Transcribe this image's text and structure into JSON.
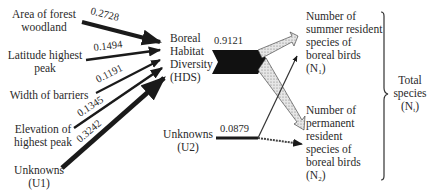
{
  "predictors": [
    {
      "id": "forest",
      "line1": "Area of forest",
      "line2": "woodland",
      "coef": "0.2728"
    },
    {
      "id": "latitude",
      "line1": "Latitude highest",
      "line2": "peak",
      "coef": "0.1494"
    },
    {
      "id": "barriers",
      "line1": "Width of barriers",
      "line2": "",
      "coef": "0.1191"
    },
    {
      "id": "elevation",
      "line1": "Elevation of",
      "line2": "highest peak",
      "coef": "0.1345"
    },
    {
      "id": "u1",
      "line1": "Unknowns",
      "line2": "(U1)",
      "coef": "0.3242"
    }
  ],
  "hds": {
    "line1": "Boreal",
    "line2": "Habitat",
    "line3": "Diversity",
    "line4": "(HDS)",
    "coef": "0.9121"
  },
  "u2": {
    "line1": "Unknowns",
    "line2": "(U2)",
    "coef": "0.0879"
  },
  "n1": {
    "line1": "Number of",
    "line2": "summer resident",
    "line3": "species of",
    "line4": "boreal birds",
    "line5_main": "(N",
    "line5_sub": "1",
    "line5_end": ")"
  },
  "n2": {
    "line1": "Number of",
    "line2": "permanent",
    "line3": "resident",
    "line4": "species of",
    "line5": "boreal birds",
    "line6_main": "(N",
    "line6_sub": "2",
    "line6_end": ")"
  },
  "total": {
    "line1": "Total",
    "line2": "species",
    "line3_main": "(N",
    "line3_sub": "t",
    "line3_end": ")"
  },
  "colors": {
    "arrow": "#1a1a1a",
    "hatch": "#d8d8d8",
    "text": "#2a2a2a"
  }
}
